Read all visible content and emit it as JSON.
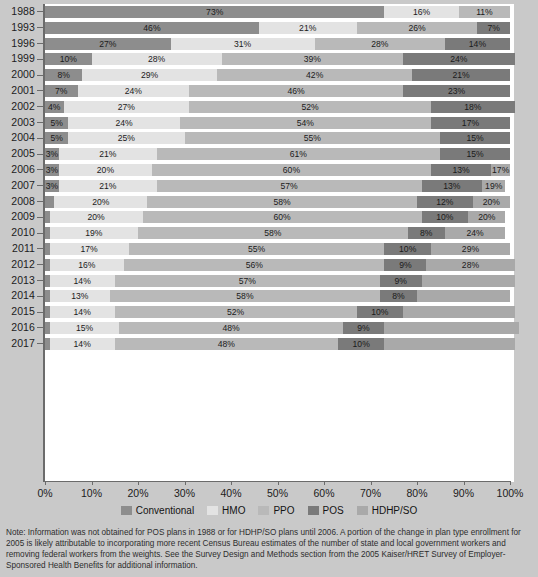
{
  "chart_data": {
    "type": "bar",
    "orientation": "horizontal",
    "stacked": true,
    "title": "",
    "xlabel": "",
    "ylabel": "",
    "xlim": [
      0,
      100
    ],
    "grid": false,
    "legend_position": "bottom",
    "categories": [
      "1988",
      "1993",
      "1996",
      "1999",
      "2000",
      "2001",
      "2002",
      "2003",
      "2004",
      "2005",
      "2006",
      "2007",
      "2008",
      "2009",
      "2010",
      "2011",
      "2012",
      "2013",
      "2014",
      "2015",
      "2016",
      "2017"
    ],
    "series": [
      {
        "name": "Conventional",
        "color": "#8d8d8d",
        "values": [
          73,
          46,
          27,
          10,
          8,
          7,
          4,
          5,
          5,
          3,
          3,
          3,
          2,
          1,
          1,
          1,
          1,
          1,
          1,
          1,
          1,
          1
        ],
        "labels": [
          "73%",
          "46%",
          "27%",
          "10%",
          "8%",
          "7%",
          "4%",
          "5%",
          "5%",
          "3%",
          "3%",
          "3%",
          "",
          "",
          "",
          "",
          "",
          "",
          "",
          "",
          "",
          ""
        ]
      },
      {
        "name": "HMO",
        "color": "#e3e3e3",
        "values": [
          16,
          21,
          31,
          28,
          29,
          24,
          27,
          24,
          25,
          21,
          20,
          21,
          20,
          20,
          19,
          17,
          16,
          14,
          13,
          14,
          15,
          14
        ],
        "labels": [
          "16%",
          "21%",
          "31%",
          "28%",
          "29%",
          "24%",
          "27%",
          "24%",
          "25%",
          "21%",
          "20%",
          "21%",
          "20%",
          "20%",
          "19%",
          "17%",
          "16%",
          "14%",
          "13%",
          "14%",
          "15%",
          "14%"
        ]
      },
      {
        "name": "PPO",
        "color": "#b9b9b9",
        "values": [
          11,
          26,
          28,
          39,
          42,
          46,
          52,
          54,
          55,
          61,
          60,
          57,
          58,
          60,
          58,
          55,
          56,
          57,
          58,
          52,
          48,
          48
        ],
        "labels": [
          "11%",
          "26%",
          "28%",
          "39%",
          "42%",
          "46%",
          "52%",
          "54%",
          "55%",
          "61%",
          "60%",
          "57%",
          "58%",
          "60%",
          "58%",
          "55%",
          "56%",
          "57%",
          "58%",
          "52%",
          "48%",
          "48%"
        ]
      },
      {
        "name": "POS",
        "color": "#7a7a7a",
        "values": [
          0,
          7,
          14,
          24,
          21,
          23,
          18,
          17,
          15,
          15,
          13,
          13,
          12,
          10,
          8,
          10,
          9,
          9,
          8,
          10,
          9,
          10
        ],
        "labels": [
          "",
          "7%",
          "14%",
          "24%",
          "21%",
          "23%",
          "18%",
          "17%",
          "15%",
          "15%",
          "13%",
          "13%",
          "12%",
          "10%",
          "8%",
          "10%",
          "9%",
          "9%",
          "8%",
          "10%",
          "9%",
          "10%"
        ]
      },
      {
        "name": "HDHP/SO",
        "color": "#a9a9a9",
        "values": [
          0,
          0,
          0,
          0,
          0,
          0,
          0,
          0,
          0,
          0,
          4,
          5,
          8,
          8,
          13,
          17,
          19,
          20,
          20,
          24,
          29,
          28
        ],
        "labels": [
          "",
          "",
          "",
          "",
          "",
          "4%",
          "5%",
          "8%",
          "8%",
          "13%",
          "17%",
          "19%",
          "20%",
          "20%",
          "24%",
          "29%",
          "28%"
        ]
      }
    ],
    "xticks": [
      0,
      10,
      20,
      30,
      40,
      50,
      60,
      70,
      80,
      90,
      100
    ],
    "xtick_labels": [
      "0%",
      "10%",
      "20%",
      "30%",
      "40%",
      "50%",
      "60%",
      "70%",
      "80%",
      "90%",
      "100%"
    ]
  },
  "legend": {
    "items": [
      {
        "label": "Conventional",
        "color": "#8d8d8d"
      },
      {
        "label": "HMO",
        "color": "#e3e3e3"
      },
      {
        "label": "PPO",
        "color": "#b9b9b9"
      },
      {
        "label": "POS",
        "color": "#7a7a7a"
      },
      {
        "label": "HDHP/SO",
        "color": "#a9a9a9"
      }
    ]
  },
  "note": {
    "text": "Note: Information was not obtained for POS plans in 1988 or for HDHP/SO plans until 2006. A portion of the change in plan type enrollment for 2005 is likely attributable to incorporating more recent Census Bureau estimates of the number of state and local government workers and removing federal workers from the weights. See the Survey Design and Methods section from the 2005 Kaiser/HRET Survey of Employer-Sponsored Health Benefits for additional information."
  }
}
